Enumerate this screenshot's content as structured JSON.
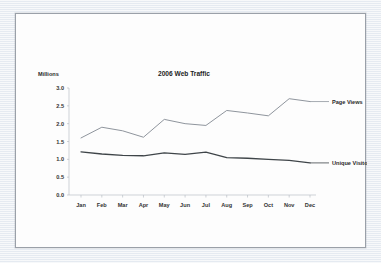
{
  "chart_data": {
    "type": "line",
    "title": "2006 Web Traffic",
    "ylabel": "Millions",
    "xlabel": "",
    "ylim": [
      0.0,
      3.0
    ],
    "yticks": [
      "0.0",
      "0.5",
      "1.0",
      "1.5",
      "2.0",
      "2.5",
      "3.0"
    ],
    "ytick_values": [
      0.0,
      0.5,
      1.0,
      1.5,
      2.0,
      2.5,
      3.0
    ],
    "grid": false,
    "legend_position": "right-inline-labels",
    "categories": [
      "Jan",
      "Feb",
      "Mar",
      "Apr",
      "May",
      "Jun",
      "Jul",
      "Aug",
      "Sep",
      "Oct",
      "Nov",
      "Dec"
    ],
    "series": [
      {
        "name": "Page Views",
        "color": "#8f959d",
        "values": [
          1.6,
          1.9,
          1.8,
          1.62,
          2.12,
          2.0,
          1.95,
          2.37,
          2.3,
          2.22,
          2.7,
          2.62
        ]
      },
      {
        "name": "Unique Visitors",
        "color": "#3f4549",
        "values": [
          1.21,
          1.15,
          1.11,
          1.1,
          1.18,
          1.14,
          1.2,
          1.05,
          1.03,
          1.0,
          0.97,
          0.9
        ]
      }
    ]
  },
  "figure": {
    "background_color": "#eef1f5",
    "panel_color": "#fdfdfd",
    "panel_border_color": "#9aa0a8"
  }
}
